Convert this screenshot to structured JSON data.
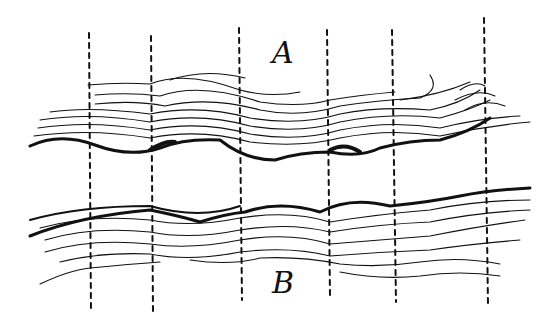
{
  "diagram": {
    "labels": {
      "top": "A",
      "bottom": "B"
    },
    "colors": {
      "ink": "#111111",
      "background": "#ffffff"
    },
    "dashed_lines_x": [
      89,
      151,
      239,
      327,
      392,
      484
    ]
  }
}
